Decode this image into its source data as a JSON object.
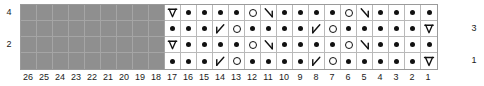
{
  "chart_data": {
    "type": "table",
    "grid": {
      "columns": 26,
      "rows": 4,
      "cell_px": 16,
      "column_order": "right-to-left",
      "row_order": "bottom-to-top"
    },
    "legend_symbols": {
      "dot": "purl",
      "yo": "yarn-over",
      "k2tog": "right-leaning-decrease",
      "ssk": "left-leaning-decrease",
      "cdd": "centered-double-decrease",
      "nostitch": "no-stitch"
    },
    "column_labels": [
      "26",
      "25",
      "24",
      "23",
      "22",
      "21",
      "20",
      "19",
      "18",
      "17",
      "16",
      "15",
      "14",
      "13",
      "12",
      "11",
      "10",
      "9",
      "8",
      "7",
      "6",
      "5",
      "4",
      "3",
      "2",
      "1"
    ],
    "row_labels_left": [
      {
        "row": 4,
        "label": "4"
      },
      {
        "row": 3,
        "label": ""
      },
      {
        "row": 2,
        "label": "2"
      },
      {
        "row": 1,
        "label": ""
      }
    ],
    "row_labels_right": [
      {
        "row": 4,
        "label": ""
      },
      {
        "row": 3,
        "label": "3"
      },
      {
        "row": 2,
        "label": ""
      },
      {
        "row": 1,
        "label": "1"
      }
    ],
    "rows": [
      {
        "row_number": 4,
        "cells": [
          "nostitch",
          "nostitch",
          "nostitch",
          "nostitch",
          "nostitch",
          "nostitch",
          "nostitch",
          "nostitch",
          "nostitch",
          "cdd",
          "dot",
          "dot",
          "dot",
          "dot",
          "yo",
          "k2tog",
          "dot",
          "dot",
          "dot",
          "dot",
          "yo",
          "k2tog",
          "dot",
          "dot",
          "dot",
          "dot"
        ]
      },
      {
        "row_number": 3,
        "cells": [
          "nostitch",
          "nostitch",
          "nostitch",
          "nostitch",
          "nostitch",
          "nostitch",
          "nostitch",
          "nostitch",
          "nostitch",
          "dot",
          "dot",
          "dot",
          "ssk",
          "yo",
          "dot",
          "dot",
          "dot",
          "dot",
          "ssk",
          "yo",
          "dot",
          "dot",
          "dot",
          "dot",
          "dot",
          "cdd"
        ]
      },
      {
        "row_number": 2,
        "cells": [
          "nostitch",
          "nostitch",
          "nostitch",
          "nostitch",
          "nostitch",
          "nostitch",
          "nostitch",
          "nostitch",
          "nostitch",
          "cdd",
          "dot",
          "dot",
          "dot",
          "dot",
          "yo",
          "k2tog",
          "dot",
          "dot",
          "dot",
          "dot",
          "yo",
          "k2tog",
          "dot",
          "dot",
          "dot",
          "dot"
        ]
      },
      {
        "row_number": 1,
        "cells": [
          "nostitch",
          "nostitch",
          "nostitch",
          "nostitch",
          "nostitch",
          "nostitch",
          "nostitch",
          "nostitch",
          "nostitch",
          "dot",
          "dot",
          "dot",
          "ssk",
          "yo",
          "dot",
          "dot",
          "dot",
          "dot",
          "ssk",
          "yo",
          "dot",
          "dot",
          "dot",
          "dot",
          "dot",
          "cdd"
        ]
      }
    ]
  },
  "colors": {
    "nostitch_fill": "#8f8f8f",
    "grid_line": "#b9b9b9",
    "grid_border": "#9a9a9a",
    "symbol_ink": "#111111",
    "label_text": "#1a1a1a"
  }
}
